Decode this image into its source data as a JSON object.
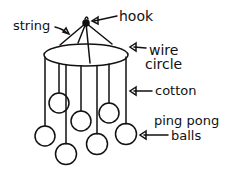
{
  "diagram": {
    "colors": {
      "ink": "#111111",
      "background": "#ffffff"
    },
    "labels": {
      "hook": "hook",
      "string": "string",
      "wire_circle_line1": "wire",
      "wire_circle_line2": "circle",
      "cotton": "cotton",
      "balls_line1": "ping pong",
      "balls_line2": "balls"
    },
    "parts": [
      "hook",
      "string",
      "wire circle",
      "cotton",
      "ping pong balls"
    ],
    "ball_count": 7
  }
}
